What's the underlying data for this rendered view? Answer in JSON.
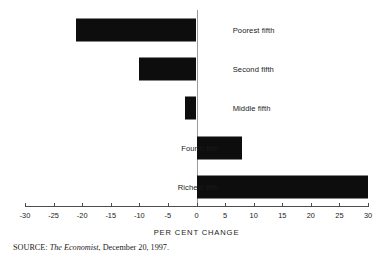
{
  "chart_data": {
    "type": "bar",
    "orientation": "horizontal",
    "title": "",
    "subtitle": "",
    "xlabel": "PER CENT CHANGE",
    "ylabel": "",
    "categories": [
      "Poorest fifth",
      "Second fifth",
      "Middle fifth",
      "Fourth fifth",
      "Richest fifth"
    ],
    "values": [
      -21,
      -10,
      -2,
      8,
      30
    ],
    "series": [
      {
        "name": "Per cent change",
        "values": [
          -21,
          -10,
          -2,
          8,
          30
        ]
      }
    ],
    "xlim": [
      -30,
      30
    ],
    "xticks": [
      -30,
      -25,
      -20,
      -15,
      -10,
      -5,
      0,
      5,
      10,
      15,
      20,
      25,
      30
    ],
    "xtick_labels": [
      "-30",
      "-25",
      "-20",
      "-15",
      "-10",
      "-5",
      "0",
      "5",
      "10",
      "15",
      "20",
      "25",
      "30"
    ],
    "grid": false,
    "legend": false,
    "legend_position": "none",
    "zero_line": true,
    "bar_color": "#0d0d0d",
    "background_color": "#ffffff",
    "axis_color": "#4d4d4d",
    "zero_line_color": "#9a9a9a"
  },
  "annotations": {
    "source": {
      "prefix": "SOURCE:",
      "publication": "The Economist",
      "suffix": ", December 20, 1997."
    }
  }
}
